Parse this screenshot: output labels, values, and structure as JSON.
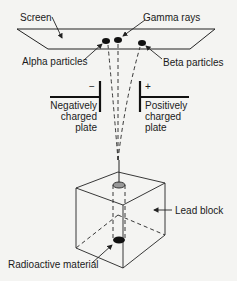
{
  "labels": {
    "screen": "Screen",
    "gamma": "Gamma rays",
    "alpha": "Alpha particles",
    "beta": "Beta particles",
    "negative_sign": "−",
    "positive_sign": "+",
    "negative_plate": "Negatively charged plate",
    "positive_plate": "Positively charged plate",
    "lead_block": "Lead block",
    "radioactive": "Radioactive material"
  },
  "colors": {
    "line": "#222222",
    "background": "#f4f4f2"
  }
}
